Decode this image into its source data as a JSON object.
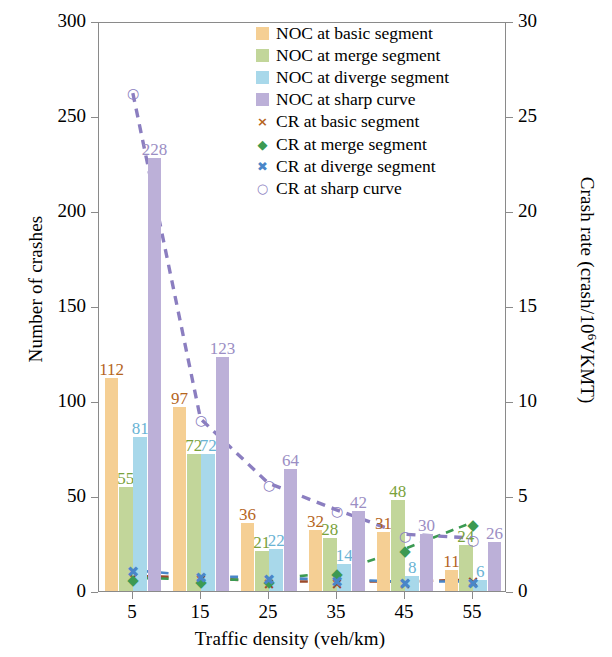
{
  "chart_data": {
    "type": "bar",
    "title": "",
    "xlabel": "Traffic density (veh/km)",
    "ylabel": "Number of crashes",
    "y2label": "Crash rate (crash/10⁶VKMT)",
    "categories": [
      "5",
      "15",
      "25",
      "35",
      "45",
      "55"
    ],
    "ylim": [
      0,
      300
    ],
    "y2lim": [
      0,
      30
    ],
    "yticks": [
      "0",
      "50",
      "100",
      "150",
      "200",
      "250",
      "300"
    ],
    "y2ticks": [
      "0",
      "5",
      "10",
      "15",
      "20",
      "25",
      "30"
    ],
    "grid": false,
    "legend_position": "top-right",
    "series": [
      {
        "name": "NOC at basic segment",
        "kind": "bar",
        "axis": "left",
        "color": "#f5cf94",
        "values": [
          112,
          97,
          36,
          32,
          31,
          11
        ],
        "labels": [
          "112",
          "97",
          "36",
          "32",
          "31",
          "11"
        ]
      },
      {
        "name": "NOC at merge segment",
        "kind": "bar",
        "axis": "left",
        "color": "#c2d69a",
        "values": [
          55,
          72,
          21,
          28,
          48,
          24
        ],
        "labels": [
          "55",
          "72",
          "21",
          "28",
          "48",
          "24"
        ]
      },
      {
        "name": "NOC at diverge segment",
        "kind": "bar",
        "axis": "left",
        "color": "#a8d8ea",
        "values": [
          81,
          72,
          22,
          14,
          8,
          6
        ],
        "labels": [
          "81",
          "72",
          "22",
          "14",
          "8",
          "6"
        ]
      },
      {
        "name": "NOC at sharp curve",
        "kind": "bar",
        "axis": "left",
        "color": "#bcb0d8",
        "values": [
          228,
          123,
          64,
          42,
          30,
          26
        ],
        "labels": [
          "228",
          "123",
          "64",
          "42",
          "30",
          "26"
        ]
      },
      {
        "name": "CR at basic segment",
        "kind": "line",
        "axis": "right",
        "color": "#9c4a2a",
        "marker": "×",
        "values": [
          0.8,
          0.7,
          0.5,
          0.5,
          0.5,
          0.6
        ]
      },
      {
        "name": "CR at merge segment",
        "kind": "line",
        "axis": "right",
        "color": "#3c9a52",
        "marker": "◆",
        "values": [
          0.7,
          0.6,
          0.6,
          1.0,
          2.2,
          3.6
        ]
      },
      {
        "name": "CR at diverge segment",
        "kind": "line",
        "axis": "right",
        "color": "#4a86c8",
        "marker": "✖",
        "values": [
          1.1,
          0.8,
          0.7,
          0.6,
          0.5,
          0.5
        ]
      },
      {
        "name": "CR at sharp curve",
        "kind": "line",
        "axis": "right",
        "color": "#8b7ec0",
        "marker": "○",
        "values": [
          26.3,
          9.1,
          5.7,
          4.3,
          3.0,
          2.8
        ]
      }
    ]
  },
  "legend": {
    "items": [
      {
        "label": "NOC at basic segment"
      },
      {
        "label": "NOC at merge segment"
      },
      {
        "label": "NOC at diverge segment"
      },
      {
        "label": "NOC at sharp curve"
      },
      {
        "label": "CR at basic segment"
      },
      {
        "label": "CR at merge segment"
      },
      {
        "label": "CR at diverge segment"
      },
      {
        "label": "CR at sharp curve"
      }
    ]
  },
  "axes": {
    "left_title": "Number of crashes",
    "right_title_a": "Crash rate (crash/10",
    "right_title_sup": "6",
    "right_title_b": "VKMT)",
    "x_title": "Traffic density (veh/km)"
  }
}
